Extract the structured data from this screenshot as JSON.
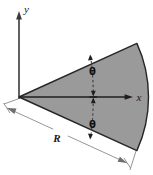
{
  "figure": {
    "type": "engineering-diagram",
    "width": 153,
    "height": 175,
    "background_color": "#ffffff"
  },
  "colors": {
    "sector_fill": "#9a9a9a",
    "sector_stroke": "#262626",
    "axis_stroke": "#3a3a3a",
    "dimension_stroke": "#707070",
    "text": "#1a1a1a"
  },
  "axes": {
    "origin": {
      "x": 19,
      "y": 97
    },
    "y_axis": {
      "label": "y",
      "icon": "axis-arrow-up-icon",
      "from": {
        "x": 19,
        "y": 97
      },
      "to": {
        "x": 19,
        "y": 16
      }
    },
    "x_axis": {
      "label": "x",
      "icon": "axis-arrow-right-icon",
      "from": {
        "x": 19,
        "y": 97
      },
      "to": {
        "x": 133,
        "y": 97
      }
    }
  },
  "sector": {
    "name": "shaded-circular-sector",
    "fill": "#9a9a9a",
    "apex": {
      "x": 19,
      "y": 97
    },
    "radius": 128,
    "half_angle_deg": 24,
    "arc_start": {
      "x": 136,
      "y": 44
    },
    "arc_end": {
      "x": 136,
      "y": 150
    },
    "arc_bulge_x": 147
  },
  "angles": [
    {
      "label": "θ",
      "name": "angle-theta-upper",
      "position": {
        "x": 92,
        "y": 71
      },
      "description": "half-angle above the x-axis"
    },
    {
      "label": "θ",
      "name": "angle-theta-lower",
      "position": {
        "x": 92,
        "y": 124
      },
      "description": "half-angle below the x-axis"
    }
  ],
  "dimensions": [
    {
      "label": "R",
      "name": "radius-dimension-R",
      "position": {
        "x": 57,
        "y": 141
      },
      "from": {
        "x": 6,
        "y": 108
      },
      "to": {
        "x": 128,
        "y": 164
      },
      "description": "radius of the sector measured along the lower straight edge"
    }
  ]
}
